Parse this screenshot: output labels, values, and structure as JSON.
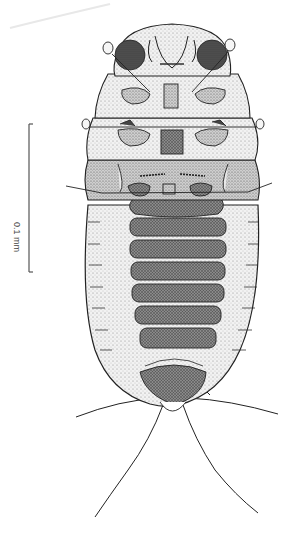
{
  "figure": {
    "scale_bar": {
      "label": "0.1 mm",
      "orientation": "vertical",
      "color": "#555555"
    },
    "colors": {
      "background": "#ffffff",
      "ink": "#1a1a1a",
      "stipple_light": "#d9d9d9",
      "stipple_dark": "#6e6e6e"
    },
    "body_parts": [
      "head",
      "eyes",
      "antennae",
      "thorax (3 segments)",
      "legs",
      "abdominal sternites (7 dark plates)",
      "terminal segment",
      "cerci (2 pairs)"
    ]
  }
}
